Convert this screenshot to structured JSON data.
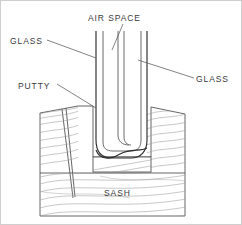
{
  "figure": {
    "background_color": "#ffffff",
    "line_color": "#555555",
    "hatch_color": "#9a9a9a",
    "text_color": "#3a3a3a",
    "width": 242,
    "height": 225
  },
  "labels": {
    "air_space": "AIR SPACE",
    "glass_left": "GLASS",
    "glass_right": "GLASS",
    "putty": "PUTTY",
    "sash": "SASH"
  },
  "parts": [
    {
      "name": "air-space",
      "label": "AIR SPACE"
    },
    {
      "name": "glass-outer-pane",
      "label": "GLASS"
    },
    {
      "name": "glass-inner-pane",
      "label": "GLASS"
    },
    {
      "name": "putty",
      "label": "PUTTY"
    },
    {
      "name": "sash",
      "label": "SASH"
    }
  ]
}
